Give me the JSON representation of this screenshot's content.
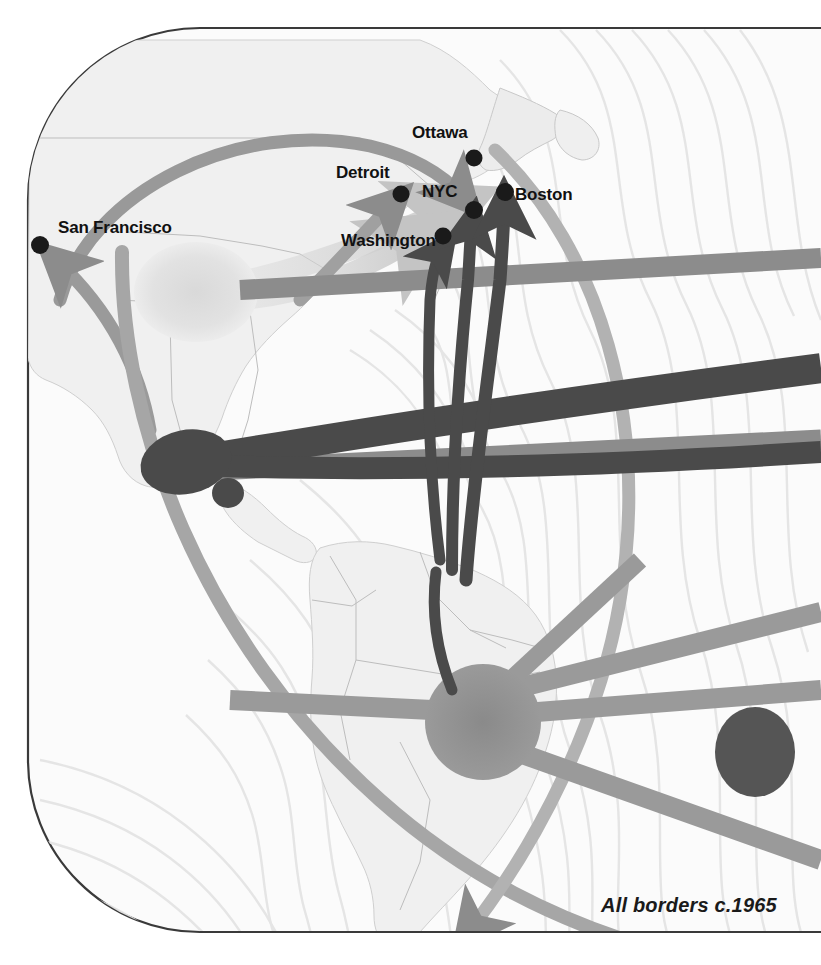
{
  "map": {
    "title_note": "All borders c.1965",
    "credit_position": "bottom-right",
    "frame": {
      "shape": "rounded-rectangle",
      "corner_radius_px": 150,
      "border_color": "#3a3a3a",
      "land_fill": "#f0f0f0",
      "ocean_fill": "#fbfbfb"
    },
    "colors": {
      "dark_flow": "#4a4a4a",
      "mid_flow": "#8c8c8c",
      "light_flow": "#c8c8c8",
      "pale_flow": "#e2e2e2",
      "city_dot": "#1a1a1a",
      "contour_line": "#e0e0e0",
      "border_line": "#b8b8b8",
      "label_text": "#111111"
    },
    "cities": [
      {
        "name": "San Francisco",
        "dot_x": 40,
        "dot_y": 245,
        "label_x": 58,
        "label_y": 228,
        "label_anchor": "left"
      },
      {
        "name": "Detroit",
        "dot_x": 401,
        "dot_y": 194,
        "label_x": 336,
        "label_y": 173,
        "label_anchor": "right"
      },
      {
        "name": "Ottawa",
        "dot_x": 474,
        "dot_y": 158,
        "label_x": 412,
        "label_y": 131,
        "label_anchor": "left"
      },
      {
        "name": "NYC",
        "dot_x": 474,
        "dot_y": 210,
        "label_x": 466,
        "label_y": 191,
        "label_anchor": "right"
      },
      {
        "name": "Boston",
        "dot_x": 505,
        "dot_y": 192,
        "label_x": 513,
        "label_y": 194,
        "label_anchor": "left"
      },
      {
        "name": "Washington",
        "dot_x": 443,
        "dot_y": 236,
        "label_x": 341,
        "label_y": 240,
        "label_anchor": "right"
      }
    ],
    "hubs": [
      {
        "name": "central-us-hub",
        "x": 196,
        "y": 292,
        "rx": 62,
        "ry": 50,
        "tone": "pale"
      },
      {
        "name": "mexico-hub",
        "x": 186,
        "y": 462,
        "rx": 46,
        "ry": 32,
        "tone": "dark"
      },
      {
        "name": "caribbean-hub",
        "x": 228,
        "y": 493,
        "rx": 16,
        "ry": 15,
        "tone": "dark"
      },
      {
        "name": "brazil-hub",
        "x": 483,
        "y": 722,
        "rx": 58,
        "ry": 58,
        "tone": "mid"
      },
      {
        "name": "atlantic-edge-hub",
        "x": 755,
        "y": 752,
        "rx": 40,
        "ry": 45,
        "tone": "dark"
      }
    ],
    "flows": [
      {
        "name": "sf-to-nyc-arc",
        "tone": "mid",
        "target": "NYC"
      },
      {
        "name": "south-to-sf-arrow",
        "tone": "mid",
        "target": "San Francisco"
      },
      {
        "name": "pale-hub-to-nyc",
        "tone": "pale",
        "target": "NYC"
      },
      {
        "name": "pale-hub-to-detroit",
        "tone": "pale",
        "target": "Detroit"
      },
      {
        "name": "mexico-to-nyc",
        "tone": "dark",
        "target": "NYC"
      },
      {
        "name": "mexico-to-washington",
        "tone": "dark",
        "target": "Washington"
      },
      {
        "name": "south-to-boston",
        "tone": "dark",
        "target": "Boston"
      },
      {
        "name": "atlantic-band-upper",
        "tone": "mid",
        "target": "east-edge"
      },
      {
        "name": "atlantic-band-lower",
        "tone": "mid",
        "target": "east-edge"
      },
      {
        "name": "brazil-spoke-ne",
        "tone": "mid",
        "target": "east-edge"
      },
      {
        "name": "brazil-spoke-e",
        "tone": "mid",
        "target": "east-edge"
      },
      {
        "name": "brazil-spoke-se",
        "tone": "mid",
        "target": "east-edge"
      },
      {
        "name": "brazil-spoke-w",
        "tone": "mid",
        "target": "west-edge"
      },
      {
        "name": "great-circle-arc",
        "tone": "mid",
        "target": "ottawa-nyc"
      }
    ]
  }
}
